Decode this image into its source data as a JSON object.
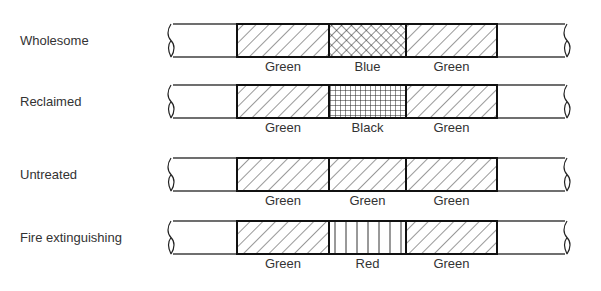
{
  "diagram": {
    "type": "pipe-identification-color-bands",
    "rows": [
      {
        "label": "Wholesome",
        "bands": [
          {
            "color": "Green",
            "pattern": "diagonal"
          },
          {
            "color": "Blue",
            "pattern": "crosshatch-diagonal"
          },
          {
            "color": "Green",
            "pattern": "diagonal"
          }
        ]
      },
      {
        "label": "Reclaimed",
        "bands": [
          {
            "color": "Green",
            "pattern": "diagonal"
          },
          {
            "color": "Black",
            "pattern": "grid"
          },
          {
            "color": "Green",
            "pattern": "diagonal"
          }
        ]
      },
      {
        "label": "Untreated",
        "bands": [
          {
            "color": "Green",
            "pattern": "diagonal"
          },
          {
            "color": "Green",
            "pattern": "diagonal"
          },
          {
            "color": "Green",
            "pattern": "diagonal"
          }
        ]
      },
      {
        "label": "Fire extinguishing",
        "bands": [
          {
            "color": "Green",
            "pattern": "diagonal"
          },
          {
            "color": "Red",
            "pattern": "vertical"
          },
          {
            "color": "Green",
            "pattern": "diagonal"
          }
        ]
      }
    ]
  }
}
